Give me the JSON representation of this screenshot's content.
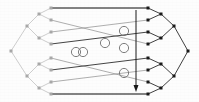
{
  "figure": {
    "type": "diagram",
    "width": 199,
    "height": 102,
    "background_color": "#fdfdfd"
  },
  "style": {
    "left_tree_color": "#b9b9b9",
    "left_tree_node_color": "#a8a8a8",
    "right_tree_color": "#2b2b2b",
    "right_tree_node_color": "#1a1a1a",
    "permutation_edge_color": "#8c8c8c",
    "permutation_edge_dark_color": "#3a3a3a",
    "crossing_circle_color": "#6f6f6f",
    "rail_color": "#5a5a5a",
    "arrow_color": "#1a1a1a",
    "edge_width": 0.7,
    "rail_width": 1.6,
    "node_radius": 1.5,
    "crossing_radius": 4.6
  },
  "left_tree": {
    "label": "left-binary-tree",
    "root": {
      "id": "L0",
      "x": 11,
      "y": 51
    },
    "internal": [
      {
        "id": "L1a",
        "x": 27,
        "y": 26
      },
      {
        "id": "L1b",
        "x": 27,
        "y": 76
      },
      {
        "id": "L2a",
        "x": 39,
        "y": 14
      },
      {
        "id": "L2b",
        "x": 39,
        "y": 38
      },
      {
        "id": "L2c",
        "x": 39,
        "y": 64
      },
      {
        "id": "L2d",
        "x": 39,
        "y": 88
      }
    ],
    "leaves": [
      {
        "id": "l1",
        "x": 51,
        "y": 8
      },
      {
        "id": "l2",
        "x": 51,
        "y": 20
      },
      {
        "id": "l3",
        "x": 51,
        "y": 32
      },
      {
        "id": "l4",
        "x": 51,
        "y": 44
      },
      {
        "id": "l5",
        "x": 51,
        "y": 58
      },
      {
        "id": "l6",
        "x": 51,
        "y": 70
      },
      {
        "id": "l7",
        "x": 51,
        "y": 82
      },
      {
        "id": "l8",
        "x": 51,
        "y": 94
      }
    ],
    "edges": [
      [
        "L0",
        "L1a"
      ],
      [
        "L0",
        "L1b"
      ],
      [
        "L1a",
        "L2a"
      ],
      [
        "L1a",
        "L2b"
      ],
      [
        "L1b",
        "L2c"
      ],
      [
        "L1b",
        "L2d"
      ],
      [
        "L2a",
        "l1"
      ],
      [
        "L2a",
        "l2"
      ],
      [
        "L2b",
        "l3"
      ],
      [
        "L2b",
        "l4"
      ],
      [
        "L2c",
        "l5"
      ],
      [
        "L2c",
        "l6"
      ],
      [
        "L2d",
        "l7"
      ],
      [
        "L2d",
        "l8"
      ]
    ]
  },
  "right_tree": {
    "label": "right-binary-tree",
    "root": {
      "id": "R0",
      "x": 188,
      "y": 51
    },
    "internal": [
      {
        "id": "R1a",
        "x": 174,
        "y": 26
      },
      {
        "id": "R1b",
        "x": 174,
        "y": 76
      },
      {
        "id": "R2a",
        "x": 161,
        "y": 14
      },
      {
        "id": "R2b",
        "x": 161,
        "y": 38
      },
      {
        "id": "R2c",
        "x": 161,
        "y": 64
      },
      {
        "id": "R2d",
        "x": 161,
        "y": 88
      }
    ],
    "leaves": [
      {
        "id": "r1",
        "x": 148,
        "y": 8
      },
      {
        "id": "r2",
        "x": 148,
        "y": 20
      },
      {
        "id": "r3",
        "x": 148,
        "y": 32
      },
      {
        "id": "r4",
        "x": 148,
        "y": 44
      },
      {
        "id": "r5",
        "x": 148,
        "y": 58
      },
      {
        "id": "r6",
        "x": 148,
        "y": 70
      },
      {
        "id": "r7",
        "x": 148,
        "y": 82
      },
      {
        "id": "r8",
        "x": 148,
        "y": 94
      }
    ],
    "edges": [
      [
        "R0",
        "R1a"
      ],
      [
        "R0",
        "R1b"
      ],
      [
        "R1a",
        "R2a"
      ],
      [
        "R1a",
        "R2b"
      ],
      [
        "R1b",
        "R2c"
      ],
      [
        "R1b",
        "R2d"
      ],
      [
        "R2a",
        "r1"
      ],
      [
        "R2a",
        "r2"
      ],
      [
        "R2b",
        "r3"
      ],
      [
        "R2b",
        "r4"
      ],
      [
        "R2c",
        "r5"
      ],
      [
        "R2c",
        "r6"
      ],
      [
        "R2d",
        "r7"
      ],
      [
        "R2d",
        "r8"
      ]
    ]
  },
  "permutation": {
    "label": "matching-edges",
    "edges": [
      {
        "from": "l1",
        "to": "r1",
        "emphasis": "rail"
      },
      {
        "from": "l2",
        "to": "r4",
        "emphasis": "light"
      },
      {
        "from": "l3",
        "to": "r2",
        "emphasis": "light"
      },
      {
        "from": "l4",
        "to": "r3",
        "emphasis": "dark"
      },
      {
        "from": "l5",
        "to": "r7",
        "emphasis": "light"
      },
      {
        "from": "l6",
        "to": "r5",
        "emphasis": "dark"
      },
      {
        "from": "l7",
        "to": "r6",
        "emphasis": "light"
      },
      {
        "from": "l8",
        "to": "r8",
        "emphasis": "rail"
      }
    ]
  },
  "crossings": [
    {
      "id": "c1",
      "x": 76,
      "y": 52
    },
    {
      "id": "c2",
      "x": 83,
      "y": 52
    },
    {
      "id": "c3",
      "x": 105,
      "y": 43
    },
    {
      "id": "c4",
      "x": 124,
      "y": 31
    },
    {
      "id": "c5",
      "x": 124,
      "y": 48
    },
    {
      "id": "c6",
      "x": 124,
      "y": 73
    }
  ],
  "arrow": {
    "label": "vertical-sweep-arrow",
    "x": 136,
    "y_start": 10,
    "y_end": 92,
    "head_width": 5,
    "head_length": 7
  }
}
